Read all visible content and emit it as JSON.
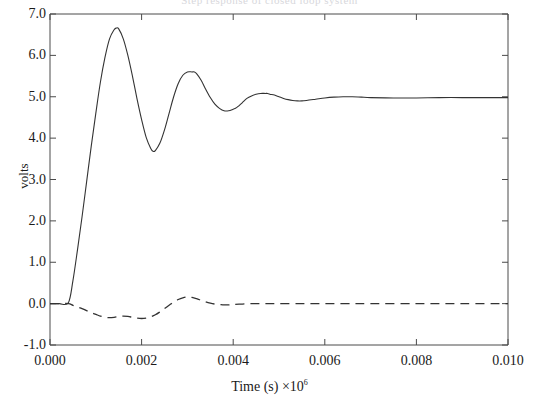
{
  "figure": {
    "title_ghost": "Step response of closed loop system",
    "width": 539,
    "height": 414
  },
  "axes": {
    "ylabel": "volts",
    "xlabel_text": "Time (s) ×10",
    "xlabel_exponent": "6",
    "ytick_labels": [
      "7.0",
      "6.0",
      "5.0",
      "4.0",
      "3.0",
      "2.0",
      "1.0",
      "0.0",
      "-1.0"
    ],
    "xtick_labels": [
      "0.000",
      "0.002",
      "0.004",
      "0.006",
      "0.008",
      "0.010"
    ]
  },
  "chart_data": {
    "type": "line",
    "title": "Step response of closed loop system",
    "xlabel": "Time (s) ×10^6",
    "ylabel": "volts",
    "xlim": [
      0.0,
      0.01
    ],
    "ylim": [
      -1.0,
      7.0
    ],
    "xticks": [
      0.0,
      0.002,
      0.004,
      0.006,
      0.008,
      0.01
    ],
    "yticks": [
      -1.0,
      0.0,
      1.0,
      2.0,
      3.0,
      4.0,
      5.0,
      6.0,
      7.0
    ],
    "grid": false,
    "legend": "none",
    "series": [
      {
        "name": "output voltage",
        "style": "solid",
        "color": "#333333",
        "x": [
          0.0,
          0.0002,
          0.0004,
          0.0005,
          0.0006,
          0.0007,
          0.0008,
          0.0009,
          0.001,
          0.0011,
          0.0012,
          0.0013,
          0.0014,
          0.00145,
          0.0015,
          0.0016,
          0.0017,
          0.0018,
          0.0019,
          0.002,
          0.0021,
          0.0022,
          0.00225,
          0.0023,
          0.0024,
          0.0025,
          0.0026,
          0.0027,
          0.0028,
          0.0029,
          0.003,
          0.0031,
          0.00315,
          0.0032,
          0.0033,
          0.0034,
          0.0035,
          0.0036,
          0.0037,
          0.0038,
          0.0039,
          0.004,
          0.00405,
          0.0041,
          0.0042,
          0.0043,
          0.0044,
          0.0045,
          0.0046,
          0.0047,
          0.00475,
          0.0048,
          0.0049,
          0.005,
          0.0051,
          0.0052,
          0.0053,
          0.0054,
          0.0055,
          0.0056,
          0.0058,
          0.006,
          0.0062,
          0.0064,
          0.0066,
          0.0068,
          0.007,
          0.0075,
          0.008,
          0.0085,
          0.009,
          0.0095,
          0.01
        ],
        "y": [
          0.0,
          0.0,
          0.02,
          0.55,
          1.3,
          2.1,
          2.95,
          3.8,
          4.6,
          5.35,
          5.95,
          6.4,
          6.62,
          6.66,
          6.64,
          6.4,
          6.0,
          5.5,
          4.95,
          4.45,
          4.02,
          3.75,
          3.68,
          3.7,
          3.88,
          4.2,
          4.6,
          5.0,
          5.32,
          5.52,
          5.6,
          5.6,
          5.6,
          5.56,
          5.4,
          5.18,
          4.98,
          4.82,
          4.72,
          4.66,
          4.66,
          4.7,
          4.72,
          4.76,
          4.86,
          4.96,
          5.02,
          5.06,
          5.08,
          5.08,
          5.08,
          5.06,
          5.04,
          5.0,
          4.96,
          4.93,
          4.91,
          4.9,
          4.9,
          4.91,
          4.94,
          4.97,
          4.99,
          5.0,
          5.0,
          4.99,
          4.98,
          4.97,
          4.97,
          4.98,
          4.98,
          4.98,
          4.98
        ]
      },
      {
        "name": "error / control signal",
        "style": "dashed",
        "color": "#333333",
        "x": [
          0.0,
          0.0002,
          0.0004,
          0.0005,
          0.0006,
          0.0007,
          0.0008,
          0.0009,
          0.001,
          0.0011,
          0.0012,
          0.0013,
          0.0014,
          0.0015,
          0.0016,
          0.0017,
          0.0018,
          0.0019,
          0.002,
          0.0021,
          0.0022,
          0.0023,
          0.0024,
          0.0025,
          0.0026,
          0.0027,
          0.0028,
          0.0029,
          0.003,
          0.0031,
          0.0032,
          0.0033,
          0.0034,
          0.0035,
          0.0036,
          0.0037,
          0.0038,
          0.0039,
          0.004,
          0.0042,
          0.0044,
          0.0046,
          0.0048,
          0.005,
          0.0055,
          0.006,
          0.0065,
          0.007,
          0.008,
          0.009,
          0.01
        ],
        "y": [
          0.0,
          0.0,
          0.0,
          -0.04,
          -0.08,
          -0.12,
          -0.17,
          -0.22,
          -0.26,
          -0.3,
          -0.33,
          -0.34,
          -0.33,
          -0.31,
          -0.3,
          -0.31,
          -0.33,
          -0.35,
          -0.36,
          -0.35,
          -0.32,
          -0.27,
          -0.2,
          -0.12,
          -0.04,
          0.04,
          0.1,
          0.14,
          0.16,
          0.15,
          0.12,
          0.08,
          0.04,
          0.01,
          -0.01,
          -0.02,
          -0.03,
          -0.03,
          -0.02,
          -0.01,
          0.0,
          0.0,
          0.0,
          0.0,
          0.0,
          0.0,
          0.0,
          0.0,
          0.0,
          0.0,
          0.0
        ]
      }
    ]
  },
  "plot_box": {
    "left": 50,
    "right": 508,
    "top": 14,
    "bottom": 345
  }
}
